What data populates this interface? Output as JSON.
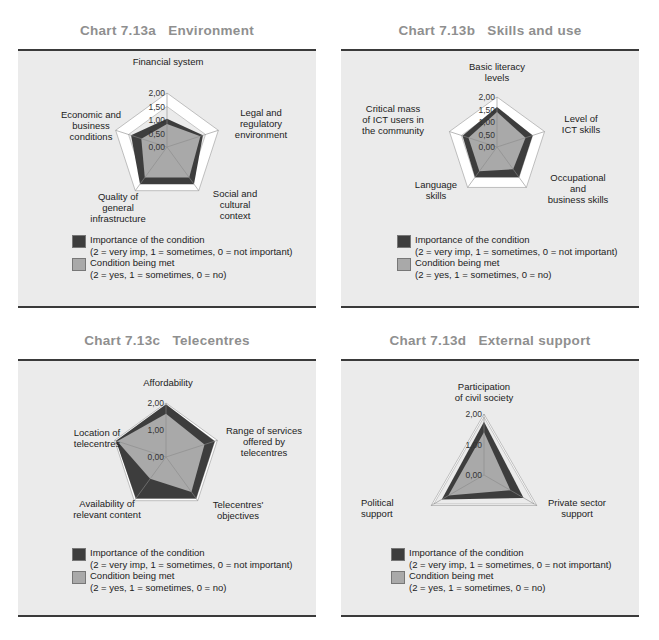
{
  "colors": {
    "importance": "#3d3d3d",
    "condition_met": "#a9a9a9",
    "panel_bg": "#ebebeb",
    "frame": "#ffffff",
    "title": "#8f8f8f"
  },
  "legend": {
    "importance_label": "Importance of the condition",
    "importance_scale": "(2 = very imp, 1 = sometimes, 0 = not important)",
    "met_label": "Condition being met",
    "met_scale": "(2 = yes, 1 = sometimes, 0 = no)"
  },
  "charts": [
    {
      "id": "a",
      "title": "Chart 7.13a   Environment",
      "ticks": [
        "2,00",
        "1,50",
        "1,00",
        "0,50",
        "0,00"
      ],
      "axis_labels": [
        "Financial system",
        "Legal and\nregulatory\nenvironment",
        "Social and\ncultural\ncontext",
        "Quality of\ngeneral\ninfrastructure",
        "Economic and\nbusiness\nconditions"
      ]
    },
    {
      "id": "b",
      "title": "Chart 7.13b   Skills and use",
      "ticks": [
        "2,00",
        "1,50",
        "1,00",
        "0,50",
        "0,00"
      ],
      "axis_labels": [
        "Basic literacy\nlevels",
        "Level of\nICT skills",
        "Occupational\nand\nbusiness skills",
        "Language\nskills",
        "Critical mass\nof ICT users in\nthe community"
      ]
    },
    {
      "id": "c",
      "title": "Chart 7.13c   Telecentres",
      "ticks": [
        "2,00",
        "1,00",
        "0,00"
      ],
      "axis_labels": [
        "Affordability",
        "Range of services\noffered by\ntelecentres",
        "Telecentres'\nobjectives",
        "Availability of\nrelevant content",
        "Location of\ntelecentres"
      ]
    },
    {
      "id": "d",
      "title": "Chart 7.13d   External support",
      "ticks": [
        "2,00",
        "1,00",
        "0,00"
      ],
      "axis_labels": [
        "Participation\nof civil society",
        "Private sector\nsupport",
        "Political\nsupport"
      ]
    }
  ],
  "chart_data": [
    {
      "type": "radar",
      "title": "Chart 7.13a Environment",
      "categories": [
        "Financial system",
        "Legal and regulatory environment",
        "Social and cultural context",
        "Quality of general infrastructure",
        "Economic and business conditions"
      ],
      "series": [
        {
          "name": "Importance of the condition",
          "values": [
            1.05,
            1.4,
            1.7,
            1.7,
            1.4
          ]
        },
        {
          "name": "Condition being met",
          "values": [
            0.85,
            1.3,
            1.4,
            1.4,
            1.0
          ]
        }
      ],
      "rlim": [
        0,
        2
      ],
      "ticks": [
        0,
        0.5,
        1.0,
        1.5,
        2.0
      ],
      "legend_position": "bottom"
    },
    {
      "type": "radar",
      "title": "Chart 7.13b Skills and use",
      "categories": [
        "Basic literacy levels",
        "Level of ICT skills",
        "Occupational and business skills",
        "Language skills",
        "Critical mass of ICT users in the community"
      ],
      "series": [
        {
          "name": "Importance of the condition",
          "values": [
            1.6,
            1.5,
            1.5,
            1.5,
            1.45
          ]
        },
        {
          "name": "Condition being met",
          "values": [
            1.4,
            1.2,
            1.1,
            1.2,
            1.2
          ]
        }
      ],
      "rlim": [
        0,
        2
      ],
      "ticks": [
        0,
        0.5,
        1.0,
        1.5,
        2.0
      ],
      "legend_position": "bottom"
    },
    {
      "type": "radar",
      "title": "Chart 7.13c Telecentres",
      "categories": [
        "Affordability",
        "Range of services offered by telecentres",
        "Telecentres' objectives",
        "Availability of relevant content",
        "Location of telecentres"
      ],
      "series": [
        {
          "name": "Importance of the condition",
          "values": [
            1.95,
            1.9,
            1.9,
            1.9,
            1.95
          ]
        },
        {
          "name": "Condition being met",
          "values": [
            1.6,
            1.5,
            1.6,
            1.0,
            1.9
          ]
        }
      ],
      "rlim": [
        0,
        2
      ],
      "ticks": [
        0,
        1.0,
        2.0
      ],
      "legend_position": "bottom"
    },
    {
      "type": "radar",
      "title": "Chart 7.13d External support",
      "categories": [
        "Participation of civil society",
        "Private sector support",
        "Political support"
      ],
      "series": [
        {
          "name": "Importance of the condition",
          "values": [
            1.75,
            1.5,
            1.6
          ]
        },
        {
          "name": "Condition being met",
          "values": [
            1.4,
            1.0,
            1.35
          ]
        }
      ],
      "rlim": [
        0,
        2
      ],
      "ticks": [
        0,
        1.0,
        2.0
      ],
      "legend_position": "bottom"
    }
  ]
}
